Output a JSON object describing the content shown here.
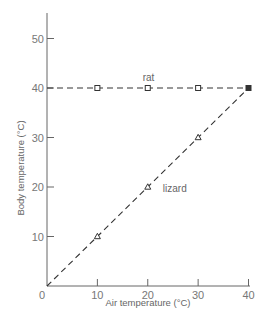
{
  "chart_data": {
    "type": "line",
    "title": "",
    "xlabel": "Air temperature (°C)",
    "ylabel": "Body temperature (°C)",
    "xlim": [
      0,
      40
    ],
    "ylim": [
      0,
      55
    ],
    "x_ticks": [
      0,
      10,
      20,
      30,
      40
    ],
    "x_tick_labels": [
      "0",
      "10",
      "20",
      "30",
      "40"
    ],
    "y_ticks": [
      10,
      20,
      30,
      40,
      50
    ],
    "y_tick_labels": [
      "10",
      "20",
      "30",
      "40",
      "50"
    ],
    "grid": false,
    "legend": "inline labels",
    "series": [
      {
        "name": "rat",
        "marker": "square",
        "line_style": "dashed",
        "x": [
          0,
          10,
          20,
          30,
          40
        ],
        "values": [
          40,
          40,
          40,
          40,
          40
        ],
        "marker_x": [
          10,
          20,
          30,
          40
        ]
      },
      {
        "name": "lizard",
        "marker": "triangle",
        "line_style": "dashed",
        "x": [
          0,
          10,
          20,
          30,
          40
        ],
        "values": [
          0,
          10,
          20,
          30,
          40
        ],
        "marker_x": [
          10,
          20,
          30,
          40
        ]
      }
    ],
    "annotations": [
      {
        "text": "rat",
        "x": 19,
        "y": 42
      },
      {
        "text": "lizard",
        "x": 23,
        "y": 19.5
      }
    ]
  }
}
